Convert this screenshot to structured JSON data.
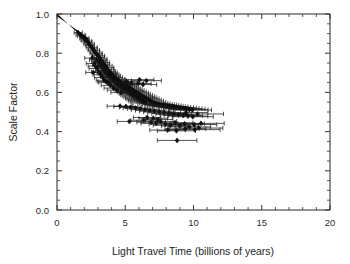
{
  "chart_data": {
    "type": "scatter",
    "title": "",
    "xlabel": "Light Travel Time (billions of years)",
    "ylabel": "Scale Factor",
    "xlim": [
      0,
      20
    ],
    "ylim": [
      0.0,
      1.0
    ],
    "xticks": [
      0,
      5,
      10,
      15,
      20
    ],
    "xticklabels": [
      "0",
      "5",
      "10",
      "15",
      "20"
    ],
    "yticks": [
      0.0,
      0.2,
      0.4,
      0.6,
      0.8,
      1.0
    ],
    "yticklabels": [
      "0.0",
      "0.2",
      "0.4",
      "0.6",
      "0.8",
      "1.0"
    ],
    "x_minor_step": 1,
    "y_minor_step": 0.05,
    "grid": false,
    "legend": null,
    "marker": "filled-diamond",
    "error_bars": "x-only-with-caps",
    "dense_core_note": "solid overlapping wedge of low-redshift points from (0,1.0) to about (2.2,0.86)",
    "points": [
      {
        "x": 1.55,
        "y": 0.905,
        "xerr": 0.3
      },
      {
        "x": 1.72,
        "y": 0.893,
        "xerr": 0.33
      },
      {
        "x": 1.8,
        "y": 0.887,
        "xerr": 0.3
      },
      {
        "x": 2.0,
        "y": 0.876,
        "xerr": 0.34
      },
      {
        "x": 2.05,
        "y": 0.868,
        "xerr": 0.3
      },
      {
        "x": 2.18,
        "y": 0.862,
        "xerr": 0.36
      },
      {
        "x": 2.28,
        "y": 0.855,
        "xerr": 0.3
      },
      {
        "x": 2.35,
        "y": 0.846,
        "xerr": 0.38
      },
      {
        "x": 2.42,
        "y": 0.84,
        "xerr": 0.32
      },
      {
        "x": 2.55,
        "y": 0.83,
        "xerr": 0.4
      },
      {
        "x": 2.62,
        "y": 0.822,
        "xerr": 0.34
      },
      {
        "x": 2.7,
        "y": 0.815,
        "xerr": 0.42
      },
      {
        "x": 2.78,
        "y": 0.806,
        "xerr": 0.36
      },
      {
        "x": 2.86,
        "y": 0.8,
        "xerr": 0.44
      },
      {
        "x": 2.95,
        "y": 0.792,
        "xerr": 0.38
      },
      {
        "x": 3.02,
        "y": 0.786,
        "xerr": 0.46
      },
      {
        "x": 3.1,
        "y": 0.778,
        "xerr": 0.4
      },
      {
        "x": 2.58,
        "y": 0.775,
        "xerr": 0.55
      },
      {
        "x": 3.18,
        "y": 0.77,
        "xerr": 0.48
      },
      {
        "x": 2.88,
        "y": 0.766,
        "xerr": 0.5
      },
      {
        "x": 3.26,
        "y": 0.762,
        "xerr": 0.42
      },
      {
        "x": 3.05,
        "y": 0.757,
        "xerr": 0.52
      },
      {
        "x": 3.34,
        "y": 0.752,
        "xerr": 0.5
      },
      {
        "x": 2.72,
        "y": 0.748,
        "xerr": 0.58
      },
      {
        "x": 3.42,
        "y": 0.744,
        "xerr": 0.44
      },
      {
        "x": 3.15,
        "y": 0.74,
        "xerr": 0.54
      },
      {
        "x": 3.52,
        "y": 0.735,
        "xerr": 0.52
      },
      {
        "x": 3.28,
        "y": 0.73,
        "xerr": 0.46
      },
      {
        "x": 3.6,
        "y": 0.726,
        "xerr": 0.56
      },
      {
        "x": 2.95,
        "y": 0.722,
        "xerr": 0.6
      },
      {
        "x": 3.7,
        "y": 0.718,
        "xerr": 0.48
      },
      {
        "x": 3.4,
        "y": 0.713,
        "xerr": 0.58
      },
      {
        "x": 3.8,
        "y": 0.708,
        "xerr": 0.5
      },
      {
        "x": 3.55,
        "y": 0.704,
        "xerr": 0.62
      },
      {
        "x": 3.9,
        "y": 0.7,
        "xerr": 0.52
      },
      {
        "x": 2.66,
        "y": 0.702,
        "xerr": 0.55
      },
      {
        "x": 3.64,
        "y": 0.696,
        "xerr": 0.64
      },
      {
        "x": 4.0,
        "y": 0.692,
        "xerr": 0.54
      },
      {
        "x": 3.76,
        "y": 0.688,
        "xerr": 0.6
      },
      {
        "x": 4.1,
        "y": 0.684,
        "xerr": 0.56
      },
      {
        "x": 3.86,
        "y": 0.68,
        "xerr": 0.66
      },
      {
        "x": 4.22,
        "y": 0.676,
        "xerr": 0.58
      },
      {
        "x": 3.98,
        "y": 0.672,
        "xerr": 0.62
      },
      {
        "x": 4.34,
        "y": 0.668,
        "xerr": 0.6
      },
      {
        "x": 4.08,
        "y": 0.665,
        "xerr": 0.68
      },
      {
        "x": 4.46,
        "y": 0.662,
        "xerr": 0.62
      },
      {
        "x": 4.2,
        "y": 0.658,
        "xerr": 0.64
      },
      {
        "x": 4.58,
        "y": 0.655,
        "xerr": 0.66
      },
      {
        "x": 3.45,
        "y": 0.662,
        "xerr": 0.58
      },
      {
        "x": 3.58,
        "y": 0.655,
        "xerr": 0.6
      },
      {
        "x": 4.7,
        "y": 0.65,
        "xerr": 0.68
      },
      {
        "x": 4.32,
        "y": 0.648,
        "xerr": 0.66
      },
      {
        "x": 4.84,
        "y": 0.645,
        "xerr": 0.7
      },
      {
        "x": 4.44,
        "y": 0.642,
        "xerr": 0.68
      },
      {
        "x": 4.96,
        "y": 0.64,
        "xerr": 0.72
      },
      {
        "x": 4.56,
        "y": 0.636,
        "xerr": 0.7
      },
      {
        "x": 5.08,
        "y": 0.634,
        "xerr": 0.74
      },
      {
        "x": 4.68,
        "y": 0.63,
        "xerr": 0.72
      },
      {
        "x": 5.2,
        "y": 0.628,
        "xerr": 0.76
      },
      {
        "x": 4.8,
        "y": 0.624,
        "xerr": 0.74
      },
      {
        "x": 5.32,
        "y": 0.622,
        "xerr": 0.78
      },
      {
        "x": 4.92,
        "y": 0.618,
        "xerr": 0.76
      },
      {
        "x": 5.44,
        "y": 0.616,
        "xerr": 0.8
      },
      {
        "x": 5.04,
        "y": 0.612,
        "xerr": 0.78
      },
      {
        "x": 5.56,
        "y": 0.61,
        "xerr": 0.82
      },
      {
        "x": 5.16,
        "y": 0.606,
        "xerr": 0.8
      },
      {
        "x": 5.7,
        "y": 0.604,
        "xerr": 0.84
      },
      {
        "x": 5.28,
        "y": 0.6,
        "xerr": 0.82
      },
      {
        "x": 5.84,
        "y": 0.598,
        "xerr": 0.86
      },
      {
        "x": 5.4,
        "y": 0.594,
        "xerr": 0.84
      },
      {
        "x": 5.96,
        "y": 0.592,
        "xerr": 0.88
      },
      {
        "x": 5.52,
        "y": 0.588,
        "xerr": 0.86
      },
      {
        "x": 6.1,
        "y": 0.586,
        "xerr": 0.9
      },
      {
        "x": 5.66,
        "y": 0.582,
        "xerr": 0.88
      },
      {
        "x": 6.24,
        "y": 0.58,
        "xerr": 0.92
      },
      {
        "x": 5.8,
        "y": 0.576,
        "xerr": 0.9
      },
      {
        "x": 6.38,
        "y": 0.574,
        "xerr": 0.94
      },
      {
        "x": 5.94,
        "y": 0.57,
        "xerr": 0.92
      },
      {
        "x": 6.52,
        "y": 0.568,
        "xerr": 0.96
      },
      {
        "x": 6.06,
        "y": 0.564,
        "xerr": 0.94
      },
      {
        "x": 6.66,
        "y": 0.562,
        "xerr": 0.98
      },
      {
        "x": 6.2,
        "y": 0.558,
        "xerr": 0.96
      },
      {
        "x": 6.8,
        "y": 0.556,
        "xerr": 1.0
      },
      {
        "x": 6.34,
        "y": 0.552,
        "xerr": 0.98
      },
      {
        "x": 6.94,
        "y": 0.55,
        "xerr": 1.02
      },
      {
        "x": 6.48,
        "y": 0.546,
        "xerr": 1.0
      },
      {
        "x": 7.08,
        "y": 0.545,
        "xerr": 1.04
      },
      {
        "x": 7.22,
        "y": 0.542,
        "xerr": 1.06
      },
      {
        "x": 7.36,
        "y": 0.54,
        "xerr": 1.08
      },
      {
        "x": 7.5,
        "y": 0.538,
        "xerr": 1.1
      },
      {
        "x": 7.64,
        "y": 0.536,
        "xerr": 1.12
      },
      {
        "x": 7.78,
        "y": 0.534,
        "xerr": 1.14
      },
      {
        "x": 7.92,
        "y": 0.532,
        "xerr": 1.16
      },
      {
        "x": 8.06,
        "y": 0.53,
        "xerr": 1.18
      },
      {
        "x": 8.2,
        "y": 0.528,
        "xerr": 1.2
      },
      {
        "x": 8.38,
        "y": 0.527,
        "xerr": 1.22
      },
      {
        "x": 8.56,
        "y": 0.525,
        "xerr": 1.24
      },
      {
        "x": 8.74,
        "y": 0.523,
        "xerr": 1.26
      },
      {
        "x": 8.92,
        "y": 0.521,
        "xerr": 1.28
      },
      {
        "x": 9.1,
        "y": 0.519,
        "xerr": 1.3
      },
      {
        "x": 9.3,
        "y": 0.517,
        "xerr": 1.32
      },
      {
        "x": 9.5,
        "y": 0.515,
        "xerr": 1.34
      },
      {
        "x": 9.7,
        "y": 0.512,
        "xerr": 1.36
      },
      {
        "x": 9.92,
        "y": 0.51,
        "xerr": 1.4
      },
      {
        "x": 6.05,
        "y": 0.665,
        "xerr": 1.05
      },
      {
        "x": 6.55,
        "y": 0.66,
        "xerr": 1.1
      },
      {
        "x": 5.1,
        "y": 0.655,
        "xerr": 0.85
      },
      {
        "x": 5.45,
        "y": 0.648,
        "xerr": 0.9
      },
      {
        "x": 5.95,
        "y": 0.645,
        "xerr": 0.95
      },
      {
        "x": 6.3,
        "y": 0.64,
        "xerr": 1.0
      },
      {
        "x": 4.62,
        "y": 0.53,
        "xerr": 0.95
      },
      {
        "x": 5.05,
        "y": 0.528,
        "xerr": 0.88
      },
      {
        "x": 5.4,
        "y": 0.524,
        "xerr": 0.82
      },
      {
        "x": 5.75,
        "y": 0.52,
        "xerr": 0.9
      },
      {
        "x": 6.1,
        "y": 0.516,
        "xerr": 0.95
      },
      {
        "x": 6.45,
        "y": 0.512,
        "xerr": 1.0
      },
      {
        "x": 6.8,
        "y": 0.508,
        "xerr": 1.05
      },
      {
        "x": 7.15,
        "y": 0.504,
        "xerr": 1.1
      },
      {
        "x": 7.5,
        "y": 0.5,
        "xerr": 1.15
      },
      {
        "x": 7.85,
        "y": 0.496,
        "xerr": 1.2
      },
      {
        "x": 8.2,
        "y": 0.492,
        "xerr": 1.25
      },
      {
        "x": 8.55,
        "y": 0.488,
        "xerr": 1.3
      },
      {
        "x": 8.9,
        "y": 0.485,
        "xerr": 1.35
      },
      {
        "x": 9.25,
        "y": 0.482,
        "xerr": 1.4
      },
      {
        "x": 9.6,
        "y": 0.479,
        "xerr": 1.45
      },
      {
        "x": 9.95,
        "y": 0.476,
        "xerr": 1.5
      },
      {
        "x": 10.3,
        "y": 0.49,
        "xerr": 1.9
      },
      {
        "x": 9.45,
        "y": 0.497,
        "xerr": 1.6
      },
      {
        "x": 5.3,
        "y": 0.452,
        "xerr": 0.88
      },
      {
        "x": 6.35,
        "y": 0.458,
        "xerr": 0.95
      },
      {
        "x": 6.9,
        "y": 0.448,
        "xerr": 1.05
      },
      {
        "x": 7.25,
        "y": 0.442,
        "xerr": 1.1
      },
      {
        "x": 7.6,
        "y": 0.452,
        "xerr": 1.15
      },
      {
        "x": 7.95,
        "y": 0.438,
        "xerr": 1.2
      },
      {
        "x": 8.3,
        "y": 0.432,
        "xerr": 1.25
      },
      {
        "x": 8.65,
        "y": 0.445,
        "xerr": 1.3
      },
      {
        "x": 9.0,
        "y": 0.428,
        "xerr": 1.35
      },
      {
        "x": 9.35,
        "y": 0.44,
        "xerr": 1.45
      },
      {
        "x": 9.7,
        "y": 0.424,
        "xerr": 1.55
      },
      {
        "x": 10.05,
        "y": 0.436,
        "xerr": 1.65
      },
      {
        "x": 10.4,
        "y": 0.418,
        "xerr": 1.75
      },
      {
        "x": 10.55,
        "y": 0.442,
        "xerr": 1.7
      },
      {
        "x": 8.1,
        "y": 0.408,
        "xerr": 1.3
      },
      {
        "x": 8.75,
        "y": 0.404,
        "xerr": 1.4
      },
      {
        "x": 9.4,
        "y": 0.414,
        "xerr": 1.5
      },
      {
        "x": 10.1,
        "y": 0.41,
        "xerr": 1.85
      },
      {
        "x": 8.8,
        "y": 0.355,
        "xerr": 1.45
      },
      {
        "x": 7.05,
        "y": 0.468,
        "xerr": 1.05
      },
      {
        "x": 7.4,
        "y": 0.462,
        "xerr": 1.1
      },
      {
        "x": 6.6,
        "y": 0.472,
        "xerr": 1.0
      },
      {
        "x": 4.7,
        "y": 0.6,
        "xerr": 0.75
      },
      {
        "x": 4.4,
        "y": 0.612,
        "xerr": 0.72
      },
      {
        "x": 4.15,
        "y": 0.622,
        "xerr": 0.7
      },
      {
        "x": 3.92,
        "y": 0.636,
        "xerr": 0.68
      },
      {
        "x": 3.72,
        "y": 0.65,
        "xerr": 0.66
      },
      {
        "x": 3.36,
        "y": 0.676,
        "xerr": 0.62
      },
      {
        "x": 3.22,
        "y": 0.69,
        "xerr": 0.58
      },
      {
        "x": 3.08,
        "y": 0.704,
        "xerr": 0.55
      },
      {
        "x": 2.8,
        "y": 0.735,
        "xerr": 0.52
      }
    ]
  }
}
